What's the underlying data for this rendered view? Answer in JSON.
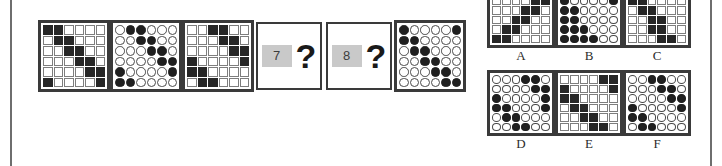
{
  "puzzle": {
    "type": "matrix-reasoning-figure",
    "grid_size": 6,
    "stem_panels": [
      {
        "name": "stem-1",
        "shape": "square",
        "index_label": "1",
        "rows": [
          [
            1,
            1,
            0,
            0,
            0,
            0
          ],
          [
            0,
            1,
            1,
            0,
            0,
            0
          ],
          [
            0,
            0,
            1,
            1,
            0,
            0
          ],
          [
            0,
            0,
            0,
            1,
            1,
            0
          ],
          [
            0,
            0,
            0,
            0,
            1,
            1
          ],
          [
            1,
            0,
            0,
            0,
            0,
            1
          ]
        ]
      },
      {
        "name": "stem-2",
        "shape": "circle",
        "index_label": "2",
        "rows": [
          [
            0,
            1,
            1,
            0,
            0,
            0
          ],
          [
            0,
            0,
            1,
            1,
            0,
            0
          ],
          [
            0,
            0,
            0,
            1,
            1,
            0
          ],
          [
            0,
            0,
            0,
            0,
            1,
            1
          ],
          [
            1,
            0,
            0,
            0,
            0,
            1
          ],
          [
            1,
            1,
            0,
            0,
            0,
            0
          ]
        ]
      },
      {
        "name": "stem-3",
        "shape": "square",
        "index_label": "3",
        "rows": [
          [
            0,
            0,
            1,
            1,
            0,
            0
          ],
          [
            0,
            0,
            0,
            1,
            1,
            0
          ],
          [
            0,
            0,
            0,
            0,
            1,
            1
          ],
          [
            1,
            0,
            0,
            0,
            0,
            1
          ],
          [
            1,
            1,
            0,
            0,
            0,
            0
          ],
          [
            0,
            1,
            1,
            0,
            0,
            0
          ]
        ]
      },
      {
        "name": "stem-6",
        "shape": "circle",
        "index_label": "6",
        "rows": [
          [
            1,
            0,
            0,
            0,
            0,
            1
          ],
          [
            1,
            1,
            0,
            0,
            0,
            0
          ],
          [
            0,
            1,
            1,
            0,
            0,
            0
          ],
          [
            0,
            0,
            1,
            1,
            0,
            0
          ],
          [
            0,
            0,
            0,
            1,
            1,
            0
          ],
          [
            0,
            0,
            0,
            0,
            1,
            1
          ]
        ]
      }
    ],
    "question_boxes": [
      {
        "name": "question-7",
        "number": "7",
        "mark": "?"
      },
      {
        "name": "question-8",
        "number": "8",
        "mark": "?"
      }
    ],
    "options": [
      {
        "label": "A",
        "shape": "square",
        "rows": [
          [
            0,
            0,
            0,
            1,
            1,
            0
          ],
          [
            0,
            0,
            0,
            0,
            1,
            1
          ],
          [
            0,
            0,
            0,
            1,
            1,
            0
          ],
          [
            0,
            0,
            1,
            1,
            0,
            0
          ],
          [
            0,
            1,
            1,
            0,
            0,
            0
          ],
          [
            1,
            1,
            0,
            0,
            0,
            0
          ]
        ]
      },
      {
        "label": "B",
        "shape": "circle",
        "rows": [
          [
            1,
            0,
            0,
            0,
            0,
            1
          ],
          [
            1,
            0,
            0,
            0,
            0,
            1
          ],
          [
            1,
            1,
            0,
            0,
            0,
            0
          ],
          [
            1,
            1,
            0,
            0,
            0,
            0
          ],
          [
            1,
            1,
            1,
            0,
            0,
            0
          ],
          [
            1,
            1,
            1,
            1,
            0,
            0
          ]
        ]
      },
      {
        "label": "C",
        "shape": "square",
        "rows": [
          [
            1,
            1,
            0,
            0,
            0,
            0
          ],
          [
            1,
            1,
            0,
            0,
            0,
            0
          ],
          [
            0,
            1,
            1,
            0,
            0,
            0
          ],
          [
            0,
            0,
            1,
            1,
            0,
            0
          ],
          [
            0,
            0,
            1,
            1,
            0,
            0
          ],
          [
            0,
            0,
            0,
            1,
            1,
            0
          ]
        ]
      },
      {
        "label": "D",
        "shape": "circle",
        "rows": [
          [
            0,
            0,
            0,
            1,
            1,
            0
          ],
          [
            0,
            0,
            0,
            0,
            1,
            1
          ],
          [
            1,
            0,
            0,
            0,
            0,
            1
          ],
          [
            1,
            1,
            0,
            0,
            0,
            1
          ],
          [
            0,
            1,
            1,
            0,
            0,
            0
          ],
          [
            0,
            0,
            1,
            1,
            0,
            0
          ]
        ]
      },
      {
        "label": "E",
        "shape": "square",
        "rows": [
          [
            0,
            0,
            0,
            0,
            1,
            1
          ],
          [
            1,
            0,
            0,
            0,
            0,
            1
          ],
          [
            1,
            1,
            0,
            0,
            0,
            0
          ],
          [
            0,
            1,
            1,
            0,
            0,
            0
          ],
          [
            0,
            0,
            1,
            1,
            0,
            0
          ],
          [
            0,
            0,
            0,
            1,
            1,
            0
          ]
        ]
      },
      {
        "label": "F",
        "shape": "circle",
        "rows": [
          [
            0,
            0,
            1,
            1,
            0,
            0
          ],
          [
            0,
            0,
            0,
            1,
            1,
            0
          ],
          [
            0,
            0,
            0,
            0,
            1,
            1
          ],
          [
            1,
            0,
            0,
            0,
            0,
            1
          ],
          [
            1,
            1,
            0,
            0,
            0,
            0
          ],
          [
            0,
            1,
            1,
            0,
            0,
            0
          ]
        ]
      }
    ]
  },
  "colors": {
    "filled": "#262626",
    "empty": "#ffffff",
    "cell_border": "#7d7d7d",
    "panel_border": "#3a3a3a",
    "rule": "#6e6e6e",
    "number_chip_bg": "#c9c9c9"
  }
}
